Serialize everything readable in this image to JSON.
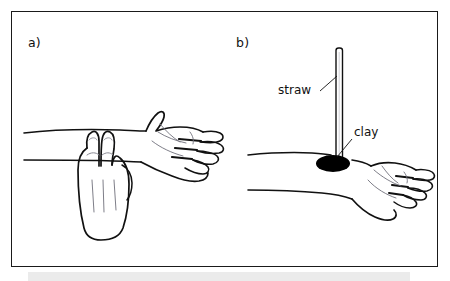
{
  "figure": {
    "background_color": "#ffffff",
    "frame_color": "#1a1a1a",
    "ink_color": "#111111",
    "shadow_band_color": "#ebebeb",
    "panels": [
      {
        "id": "a",
        "label": "a)",
        "description": "Two fingers of one hand pressed on the wrist of an outstretched forearm to feel the pulse",
        "callouts": []
      },
      {
        "id": "b",
        "label": "b)",
        "description": "A drinking straw stuck upright into a lump of clay placed on the wrist over the radial artery",
        "callouts": [
          {
            "name": "straw",
            "label": "straw"
          },
          {
            "name": "clay",
            "label": "clay"
          }
        ]
      }
    ],
    "elements": {
      "straw_label": "straw",
      "clay_label": "clay",
      "clay_fill": "#000000",
      "straw_fill": "#ffffff"
    }
  }
}
